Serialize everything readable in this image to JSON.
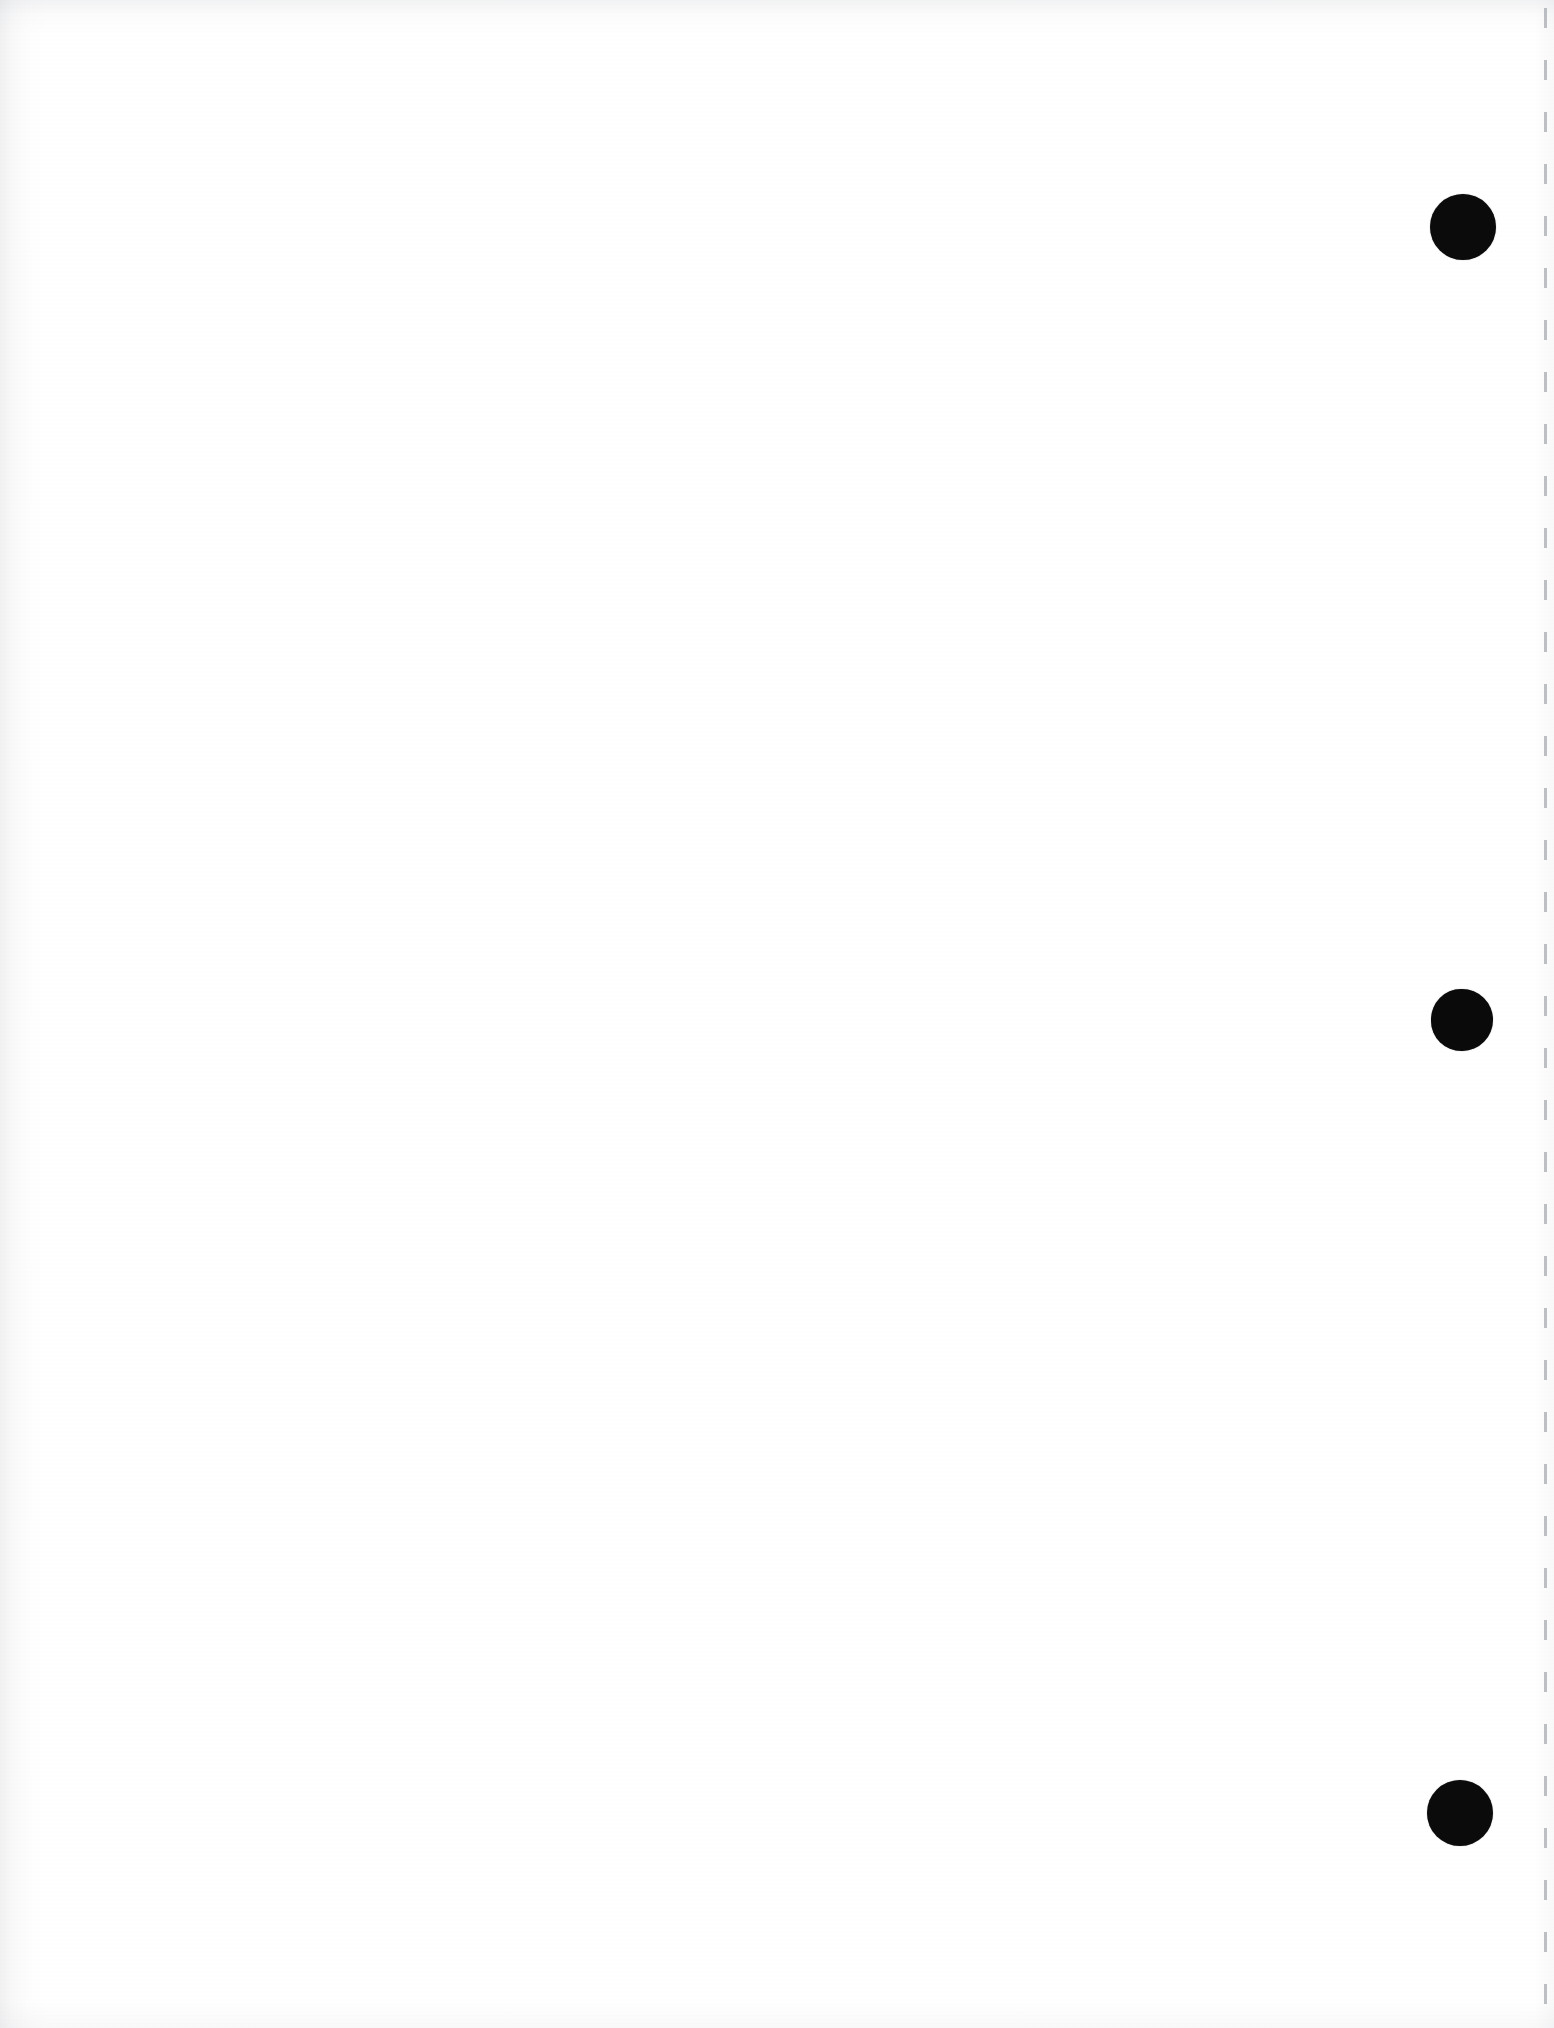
{
  "page": {
    "kind": "scanned-blank-page",
    "width": 1554,
    "height": 2028,
    "background_color": "#ffffff",
    "paper_tint_color": "#fdfdfe",
    "body_text": "",
    "page_number": "",
    "header_text": "",
    "footer_text": ""
  },
  "marks": {
    "punch_dots": [
      {
        "id": "punch-dot-top",
        "label": "",
        "color": "#0b0b0b",
        "center_x": 1463,
        "center_y": 227,
        "diameter": 66
      },
      {
        "id": "punch-dot-middle",
        "label": "",
        "color": "#0a0a0a",
        "center_x": 1462,
        "center_y": 1020,
        "diameter": 62
      },
      {
        "id": "punch-dot-bottom",
        "label": "",
        "color": "#0b0b0b",
        "center_x": 1460,
        "center_y": 1813,
        "diameter": 66
      }
    ],
    "trim_line": {
      "id": "right-margin-trim-line",
      "color": "#969aa0",
      "x": 1545,
      "top": 8,
      "height": 2014,
      "thickness": 3,
      "dash_length": 20,
      "dash_gap": 32,
      "opacity": "0.62"
    }
  },
  "edges": {
    "left_shadow_color": "#a0a3aa",
    "top_shadow_color": "#a5a8af",
    "bottom_shadow_color": "#b4b7be",
    "right_shadow_color": "#b9bcc3"
  }
}
